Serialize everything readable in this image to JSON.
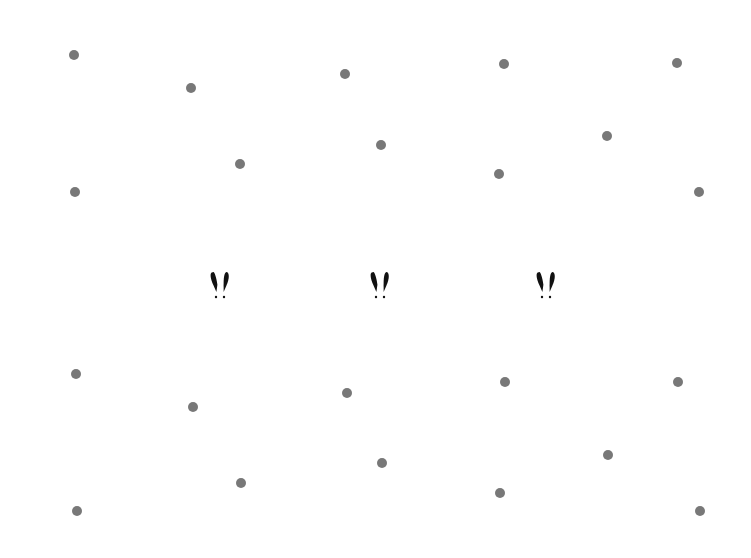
{
  "canvas": {
    "width": 751,
    "height": 558,
    "background": "#ffffff"
  },
  "dot_color": "#787878",
  "glyph_color": "#111111",
  "dots": [
    {
      "x": 74,
      "y": 55
    },
    {
      "x": 191,
      "y": 88
    },
    {
      "x": 345,
      "y": 74
    },
    {
      "x": 504,
      "y": 64
    },
    {
      "x": 677,
      "y": 63
    },
    {
      "x": 240,
      "y": 164
    },
    {
      "x": 381,
      "y": 145
    },
    {
      "x": 607,
      "y": 136
    },
    {
      "x": 499,
      "y": 174
    },
    {
      "x": 75,
      "y": 192
    },
    {
      "x": 699,
      "y": 192
    },
    {
      "x": 76,
      "y": 374
    },
    {
      "x": 193,
      "y": 407
    },
    {
      "x": 347,
      "y": 393
    },
    {
      "x": 505,
      "y": 382
    },
    {
      "x": 678,
      "y": 382
    },
    {
      "x": 241,
      "y": 483
    },
    {
      "x": 382,
      "y": 463
    },
    {
      "x": 608,
      "y": 455
    },
    {
      "x": 500,
      "y": 493
    },
    {
      "x": 77,
      "y": 511
    },
    {
      "x": 700,
      "y": 511
    }
  ],
  "glyphs": [
    {
      "symbol": "!!",
      "x": 220,
      "y": 285
    },
    {
      "symbol": "!!",
      "x": 380,
      "y": 285
    },
    {
      "symbol": "!!",
      "x": 546,
      "y": 285
    }
  ]
}
